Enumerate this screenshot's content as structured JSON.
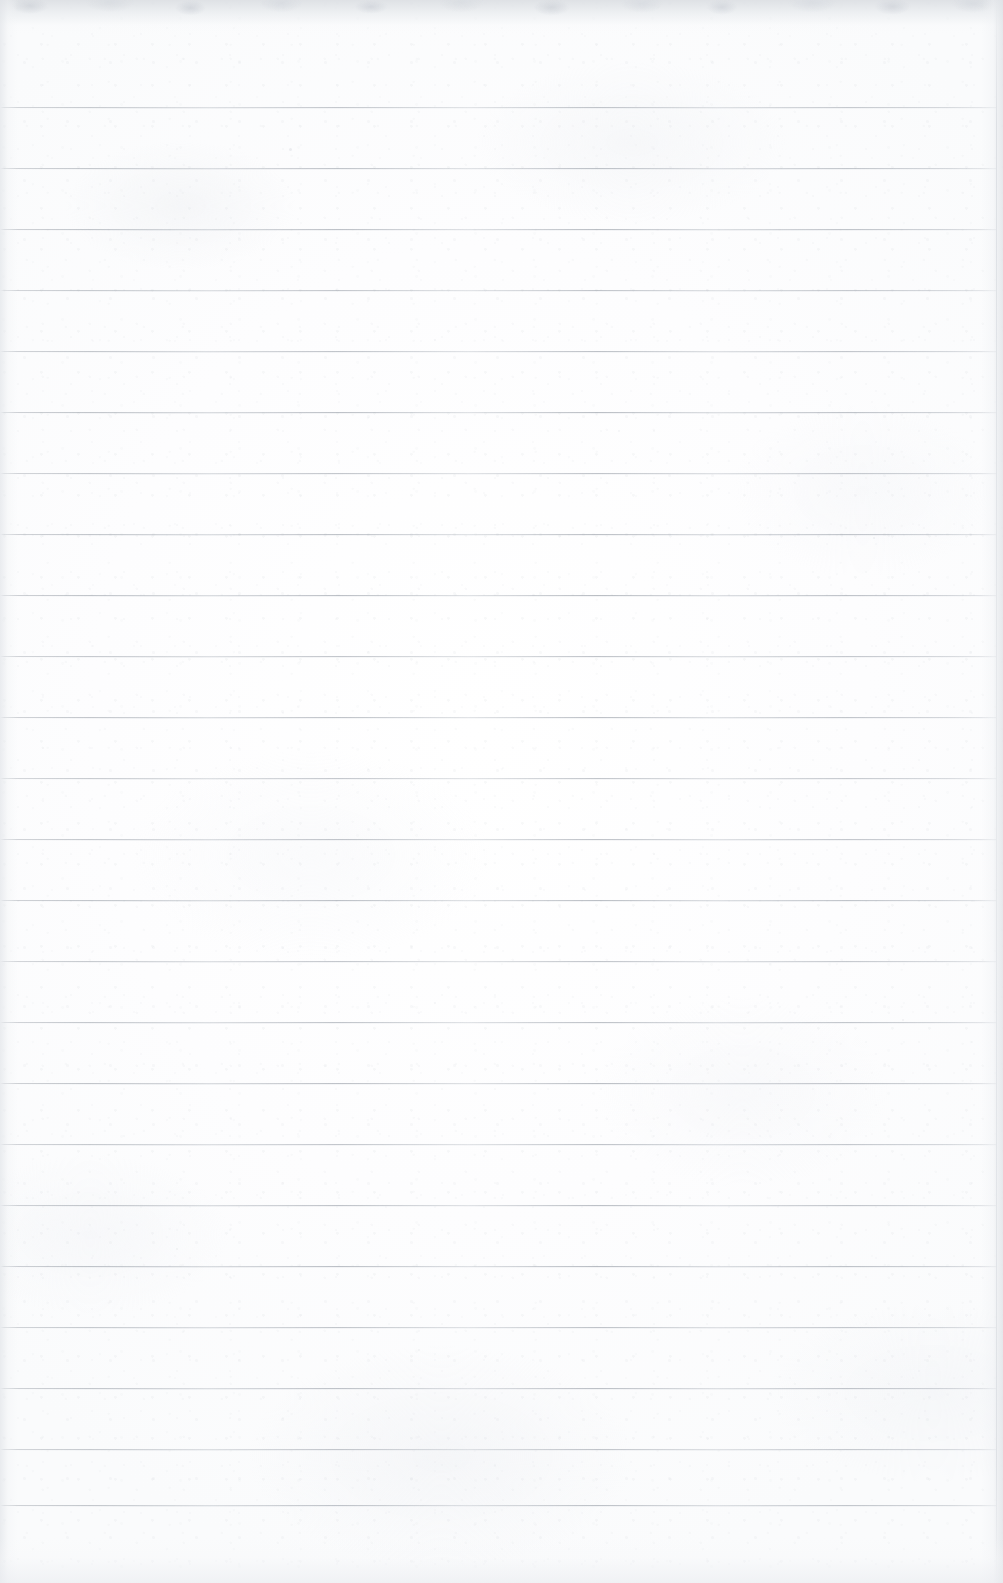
{
  "document": {
    "kind": "scanned-blank-lined-paper",
    "title": "Blank Lined Notebook Page",
    "caption": "Scan of a blank, wide-ruled sheet of notebook paper. No handwriting, printed text, headings, or marks of any kind are present — only the horizontal ruling lines and the paper's surface texture.",
    "width_px": 1003,
    "height_px": 1583,
    "orientation": "portrait",
    "visible_text": "",
    "text_content_note": "No legible text appears anywhere in the image."
  },
  "paper": {
    "background_color": "#fdfdfe",
    "highlight_color": "#ffffff",
    "texture_tint": "#eceef1",
    "edge_shadow_color": "#dde0e4",
    "has_margin_line": false,
    "has_holes": false,
    "has_header": false
  },
  "ruling": {
    "style": "horizontal ruled lines",
    "line_color": "#9aa0a9",
    "line_ghost_color": "#ced2d8",
    "line_thickness_px": 1,
    "first_line_y": 107,
    "spacing_px": 61,
    "line_count": 24,
    "line_start_x": 0,
    "line_end_x": 996,
    "line_y_positions": [
      107,
      168,
      229,
      290,
      351,
      412,
      473,
      534,
      595,
      656,
      717,
      778,
      839,
      900,
      961,
      1022,
      1083,
      1144,
      1205,
      1266,
      1327,
      1388,
      1449,
      1505
    ]
  },
  "edges": {
    "top_band_height_px": 34,
    "left_band_width_px": 18,
    "right_band_width_px": 22,
    "bottom_band_height_px": 46,
    "top_edge_note": "mottled grey scanner edge across the top",
    "right_edge_note": "faint vertical hairline where the ruling stops"
  },
  "specks": [
    {
      "x": 289,
      "y": 148,
      "size": 3,
      "opacity": 0.45
    },
    {
      "x": 873,
      "y": 537,
      "size": 2,
      "opacity": 0.38
    },
    {
      "x": 902,
      "y": 1019,
      "size": 2,
      "opacity": 0.34
    },
    {
      "x": 176,
      "y": 1248,
      "size": 2,
      "opacity": 0.3
    },
    {
      "x": 618,
      "y": 430,
      "size": 2,
      "opacity": 0.28
    },
    {
      "x": 418,
      "y": 1349,
      "size": 2,
      "opacity": 0.3
    }
  ]
}
